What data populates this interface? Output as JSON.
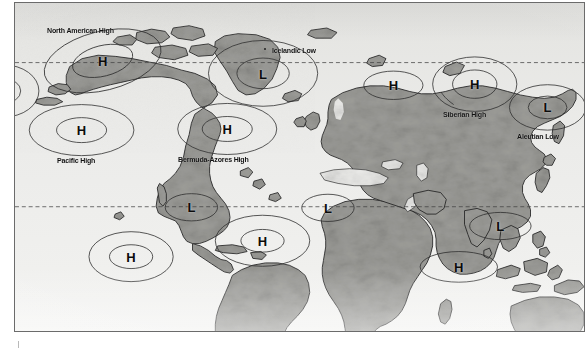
{
  "figure": {
    "kind": "world-map",
    "background_color": "#e9e9e6",
    "land_color": "#9a9a96",
    "ocean_color": "#e9e9e6",
    "frame_color": "#6b6b6b",
    "line_color": "#3a3a3a"
  },
  "latitude_lines": [
    {
      "id": "northern-dashed-line",
      "y_pct": 18.2,
      "style": "dashed"
    },
    {
      "id": "southern-dashed-line",
      "y_pct": 62.1,
      "style": "dashed"
    }
  ],
  "pressure_cells": [
    {
      "id": "north-american-high",
      "glyph": "H",
      "type": "high",
      "label": "North American High",
      "label_visible": true,
      "glyph_x_pct": 15.4,
      "glyph_y_pct": 17.6,
      "label_x_pct": 5.7,
      "label_y_pct": 7.1,
      "outer_rx_pct": 10.5,
      "outer_ry_pct": 7.3,
      "outer_rotate": -14,
      "inner_rx_pct": 5.4,
      "inner_ry_pct": 3.9,
      "inner_rotate": -14
    },
    {
      "id": "icelandic-low",
      "glyph": "L",
      "type": "low",
      "label": "Icelandic Low",
      "label_visible": true,
      "glyph_x_pct": 43.6,
      "glyph_y_pct": 21.5,
      "label_x_pct": 45.2,
      "label_y_pct": 13.0,
      "outer_rx_pct": 9.6,
      "outer_ry_pct": 7.1,
      "outer_rotate": 0,
      "inner_rx_pct": 4.6,
      "inner_ry_pct": 3.4,
      "inner_rotate": 0,
      "marker_x_pct": 44.0,
      "marker_y_pct": 13.0
    },
    {
      "id": "eurasian-high",
      "glyph": "H",
      "type": "high",
      "label": "",
      "label_visible": false,
      "glyph_x_pct": 66.5,
      "glyph_y_pct": 25.0,
      "outer_rx_pct": 5.2,
      "outer_ry_pct": 3.6,
      "outer_rotate": 0,
      "inner_rx_pct": 0,
      "inner_ry_pct": 0,
      "inner_rotate": 0
    },
    {
      "id": "siberian-high",
      "glyph": "H",
      "type": "high",
      "label": "Siberian High",
      "label_visible": true,
      "glyph_x_pct": 80.8,
      "glyph_y_pct": 24.7,
      "label_x_pct": 75.2,
      "label_y_pct": 32.6,
      "outer_rx_pct": 7.4,
      "outer_ry_pct": 6.0,
      "outer_rotate": 0,
      "inner_rx_pct": 3.9,
      "inner_ry_pct": 3.2,
      "inner_rotate": 0,
      "leader": {
        "x1_pct": 77.1,
        "y1_pct": 30.9,
        "x2_pct": 74.9,
        "y2_pct": 27.1
      }
    },
    {
      "id": "aleutian-low",
      "glyph": "L",
      "type": "low",
      "label": "Aleutian Low",
      "label_visible": true,
      "glyph_x_pct": 93.6,
      "glyph_y_pct": 31.8,
      "label_x_pct": 88.3,
      "label_y_pct": 39.2,
      "outer_rx_pct": 6.7,
      "outer_ry_pct": 5.0,
      "outer_rotate": 0,
      "inner_rx_pct": 3.4,
      "inner_ry_pct": 2.6,
      "inner_rotate": 0
    },
    {
      "id": "pacific-high",
      "glyph": "H",
      "type": "high",
      "label": "Pacific High",
      "label_visible": true,
      "glyph_x_pct": 11.7,
      "glyph_y_pct": 38.8,
      "label_x_pct": 7.4,
      "label_y_pct": 46.5,
      "outer_rx_pct": 9.2,
      "outer_ry_pct": 5.6,
      "outer_rotate": 0,
      "inner_rx_pct": 4.4,
      "inner_ry_pct": 2.8,
      "inner_rotate": 0
    },
    {
      "id": "bermuda-azores-high",
      "glyph": "H",
      "type": "high",
      "label": "Bermuda-Azores High",
      "label_visible": true,
      "glyph_x_pct": 37.3,
      "glyph_y_pct": 38.5,
      "label_x_pct": 28.7,
      "label_y_pct": 46.4,
      "outer_rx_pct": 8.7,
      "outer_ry_pct": 5.6,
      "outer_rotate": 0,
      "inner_rx_pct": 4.4,
      "inner_ry_pct": 2.8,
      "inner_rotate": 0
    },
    {
      "id": "partial-west-pacific-high",
      "glyph": "",
      "type": "high",
      "label": "",
      "label_visible": false,
      "glyph_x_pct": -2.0,
      "glyph_y_pct": 26.8,
      "outer_rx_pct": 6.2,
      "outer_ry_pct": 4.6,
      "outer_rotate": 0,
      "inner_rx_pct": 3.0,
      "inner_ry_pct": 2.2,
      "inner_rotate": 0
    },
    {
      "id": "south-american-low",
      "glyph": "L",
      "type": "low",
      "label": "",
      "label_visible": false,
      "glyph_x_pct": 31.0,
      "glyph_y_pct": 62.3,
      "outer_rx_pct": 4.6,
      "outer_ry_pct": 3.2,
      "outer_rotate": 0,
      "inner_rx_pct": 0,
      "inner_ry_pct": 0,
      "inner_rotate": 0
    },
    {
      "id": "african-low",
      "glyph": "L",
      "type": "low",
      "label": "",
      "label_visible": false,
      "glyph_x_pct": 55.0,
      "glyph_y_pct": 62.4,
      "outer_rx_pct": 4.6,
      "outer_ry_pct": 3.2,
      "outer_rotate": 0,
      "inner_rx_pct": 0,
      "inner_ry_pct": 0,
      "inner_rotate": 0
    },
    {
      "id": "australian-low",
      "glyph": "L",
      "type": "low",
      "label": "",
      "label_visible": false,
      "glyph_x_pct": 85.3,
      "glyph_y_pct": 68.0,
      "outer_rx_pct": 5.4,
      "outer_ry_pct": 3.2,
      "outer_rotate": 0,
      "inner_rx_pct": 0,
      "inner_ry_pct": 0,
      "inner_rotate": 0
    },
    {
      "id": "south-pacific-high",
      "glyph": "H",
      "type": "high",
      "label": "",
      "label_visible": false,
      "glyph_x_pct": 20.4,
      "glyph_y_pct": 77.4,
      "outer_rx_pct": 7.4,
      "outer_ry_pct": 5.4,
      "outer_rotate": 0,
      "inner_rx_pct": 3.8,
      "inner_ry_pct": 2.6,
      "inner_rotate": 0
    },
    {
      "id": "south-atlantic-high",
      "glyph": "H",
      "type": "high",
      "label": "",
      "label_visible": false,
      "glyph_x_pct": 43.5,
      "glyph_y_pct": 72.5,
      "outer_rx_pct": 8.3,
      "outer_ry_pct": 5.6,
      "outer_rotate": 0,
      "inner_rx_pct": 3.8,
      "inner_ry_pct": 2.5,
      "inner_rotate": 0
    },
    {
      "id": "south-indian-high",
      "glyph": "H",
      "type": "high",
      "label": "",
      "label_visible": false,
      "glyph_x_pct": 78.0,
      "glyph_y_pct": 80.4,
      "outer_rx_pct": 6.8,
      "outer_ry_pct": 3.4,
      "outer_rotate": 0,
      "inner_rx_pct": 0,
      "inner_ry_pct": 0,
      "inner_rotate": 0
    }
  ]
}
